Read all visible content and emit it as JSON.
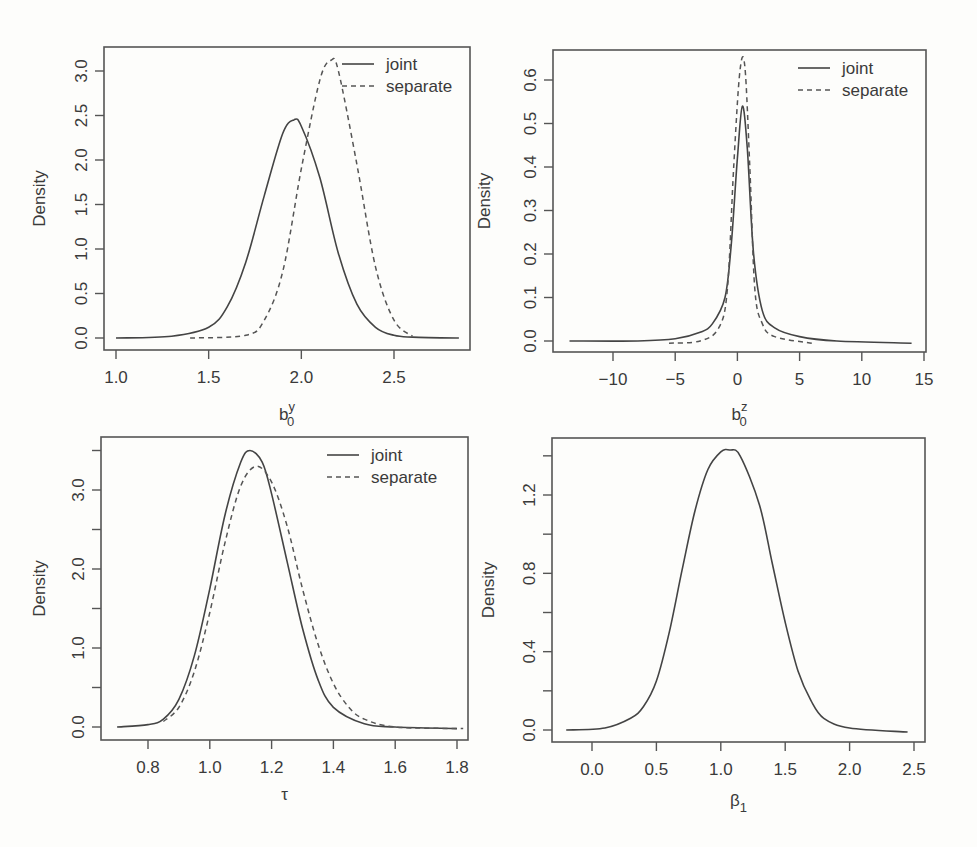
{
  "figure": {
    "legend": {
      "solid_label": "joint",
      "dashed_label": "separate"
    },
    "ylabel": "Density"
  },
  "chart_data": [
    {
      "type": "line",
      "panel": "top-left",
      "title": "",
      "xlabel": "b0^y",
      "xlabel_base": "b",
      "xlabel_sup": "y",
      "xlabel_sub": "0",
      "ylabel": "Density",
      "xlim": [
        0.95,
        2.9
      ],
      "ylim": [
        0.0,
        3.2
      ],
      "xticks": [
        1.0,
        1.5,
        2.0,
        2.5
      ],
      "xtick_labels": [
        "1.0",
        "1.5",
        "2.0",
        "2.5"
      ],
      "yticks": [
        0.0,
        0.5,
        1.0,
        1.5,
        2.0,
        2.5,
        3.0
      ],
      "ytick_labels": [
        "0.0",
        "0.5",
        "1.0",
        "1.5",
        "2.0",
        "2.5",
        "3.0"
      ],
      "legend": [
        "joint",
        "separate"
      ],
      "legend_position": "top-right",
      "grid": false,
      "series": [
        {
          "name": "joint",
          "style": "solid",
          "x": [
            1.0,
            1.3,
            1.5,
            1.6,
            1.7,
            1.8,
            1.9,
            1.96,
            2.0,
            2.1,
            2.2,
            2.3,
            2.4,
            2.5,
            2.6,
            2.85
          ],
          "y": [
            0.0,
            0.02,
            0.12,
            0.35,
            0.85,
            1.6,
            2.3,
            2.45,
            2.38,
            1.8,
            0.95,
            0.38,
            0.12,
            0.03,
            0.01,
            0.0
          ]
        },
        {
          "name": "separate",
          "style": "dashed",
          "x": [
            1.4,
            1.7,
            1.8,
            1.9,
            2.0,
            2.1,
            2.16,
            2.2,
            2.3,
            2.4,
            2.5,
            2.6
          ],
          "y": [
            0.0,
            0.03,
            0.2,
            0.75,
            1.9,
            2.9,
            3.12,
            3.0,
            1.95,
            0.8,
            0.2,
            0.02
          ]
        }
      ]
    },
    {
      "type": "line",
      "panel": "top-right",
      "title": "",
      "xlabel": "b0^z",
      "xlabel_base": "b",
      "xlabel_sup": "z",
      "xlabel_sub": "0",
      "ylabel": "Density",
      "xlim": [
        -15,
        15
      ],
      "ylim": [
        0.0,
        0.65
      ],
      "xticks": [
        -10,
        -5,
        0,
        5,
        10,
        15
      ],
      "xtick_labels": [
        "−10",
        "−5",
        "0",
        "5",
        "10",
        "15"
      ],
      "yticks": [
        0.0,
        0.1,
        0.2,
        0.3,
        0.4,
        0.5,
        0.6
      ],
      "ytick_labels": [
        "0.0",
        "0.1",
        "0.2",
        "0.3",
        "0.4",
        "0.5",
        "0.6"
      ],
      "legend": [
        "joint",
        "separate"
      ],
      "legend_position": "top-right",
      "grid": false,
      "series": [
        {
          "name": "joint",
          "style": "solid",
          "x": [
            -13.5,
            -8,
            -5,
            -3,
            -2,
            -1,
            -0.5,
            0,
            0.4,
            0.8,
            1.3,
            2,
            3,
            5,
            8,
            14
          ],
          "y": [
            0.0,
            0.0,
            0.005,
            0.02,
            0.04,
            0.1,
            0.22,
            0.42,
            0.54,
            0.44,
            0.2,
            0.07,
            0.03,
            0.01,
            0.0,
            -0.005
          ]
        },
        {
          "name": "separate",
          "style": "dashed",
          "x": [
            -5.5,
            -3,
            -1.5,
            -0.8,
            -0.3,
            0.2,
            0.6,
            1.0,
            1.4,
            2,
            3,
            6
          ],
          "y": [
            -0.005,
            0.0,
            0.03,
            0.12,
            0.4,
            0.62,
            0.63,
            0.4,
            0.12,
            0.04,
            0.01,
            -0.005
          ]
        }
      ]
    },
    {
      "type": "line",
      "panel": "bottom-left",
      "title": "",
      "xlabel": "τ",
      "ylabel": "Density",
      "xlim": [
        0.67,
        1.82
      ],
      "ylim": [
        0.0,
        3.55
      ],
      "xticks": [
        0.8,
        1.0,
        1.2,
        1.4,
        1.6,
        1.8
      ],
      "xtick_labels": [
        "0.8",
        "1.0",
        "1.2",
        "1.4",
        "1.6",
        "1.8"
      ],
      "yticks": [
        0.0,
        0.5,
        1.0,
        1.5,
        2.0,
        2.5,
        3.0,
        3.5
      ],
      "ytick_labels": [
        "0.0",
        "",
        "1.0",
        "",
        "2.0",
        "",
        "3.0",
        ""
      ],
      "legend": [
        "joint",
        "separate"
      ],
      "legend_position": "top-right",
      "grid": false,
      "series": [
        {
          "name": "joint",
          "style": "solid",
          "x": [
            0.7,
            0.8,
            0.85,
            0.9,
            0.95,
            1.0,
            1.05,
            1.1,
            1.13,
            1.17,
            1.2,
            1.25,
            1.3,
            1.35,
            1.4,
            1.5,
            1.6,
            1.8
          ],
          "y": [
            0.0,
            0.03,
            0.1,
            0.35,
            0.9,
            1.75,
            2.7,
            3.35,
            3.5,
            3.35,
            2.95,
            2.1,
            1.25,
            0.6,
            0.25,
            0.04,
            0.0,
            -0.02
          ]
        },
        {
          "name": "separate",
          "style": "dashed",
          "x": [
            0.85,
            0.9,
            0.95,
            1.0,
            1.05,
            1.1,
            1.15,
            1.2,
            1.25,
            1.3,
            1.35,
            1.4,
            1.45,
            1.5,
            1.6,
            1.82
          ],
          "y": [
            0.07,
            0.25,
            0.7,
            1.45,
            2.35,
            3.05,
            3.3,
            3.1,
            2.55,
            1.75,
            1.05,
            0.55,
            0.25,
            0.1,
            0.0,
            -0.02
          ]
        }
      ]
    },
    {
      "type": "line",
      "panel": "bottom-right",
      "title": "",
      "xlabel": "β₁",
      "xlabel_base": "β",
      "xlabel_sub": "1",
      "ylabel": "Density",
      "xlim": [
        -0.3,
        2.6
      ],
      "ylim": [
        0.0,
        1.45
      ],
      "xticks": [
        0.0,
        0.5,
        1.0,
        1.5,
        2.0,
        2.5
      ],
      "xtick_labels": [
        "0.0",
        "0.5",
        "1.0",
        "1.5",
        "2.0",
        "2.5"
      ],
      "yticks": [
        0.0,
        0.2,
        0.4,
        0.6,
        0.8,
        1.0,
        1.2,
        1.4
      ],
      "ytick_labels": [
        "0.0",
        "",
        "0.4",
        "",
        "0.8",
        "",
        "1.2",
        ""
      ],
      "legend": [],
      "grid": false,
      "series": [
        {
          "name": "posterior",
          "style": "solid",
          "x": [
            -0.2,
            0.1,
            0.3,
            0.4,
            0.5,
            0.6,
            0.7,
            0.8,
            0.9,
            1.0,
            1.07,
            1.15,
            1.3,
            1.4,
            1.5,
            1.6,
            1.7,
            1.8,
            2.0,
            2.45
          ],
          "y": [
            0.0,
            0.01,
            0.06,
            0.12,
            0.25,
            0.5,
            0.82,
            1.12,
            1.33,
            1.42,
            1.43,
            1.4,
            1.15,
            0.85,
            0.55,
            0.3,
            0.15,
            0.06,
            0.01,
            -0.01
          ]
        }
      ]
    }
  ]
}
